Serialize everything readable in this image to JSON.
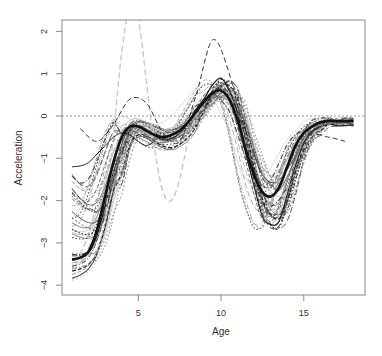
{
  "chart_data": {
    "type": "line",
    "title": "",
    "xlabel": "Age",
    "ylabel": "Acceleration",
    "xlim": [
      1,
      18
    ],
    "ylim": [
      -4.2,
      2.2
    ],
    "x_ticks": [
      5,
      10,
      15
    ],
    "x_tick_labels": [
      "5",
      "10",
      "15"
    ],
    "y_ticks": [
      -4,
      -3,
      -2,
      -1,
      0,
      1,
      2
    ],
    "y_tick_labels": [
      "-4",
      "-3",
      "-2",
      "-1",
      "0",
      "1",
      "2"
    ],
    "grid": false,
    "legend": null,
    "reference_line": {
      "y": 0,
      "style": "dotted",
      "color": "#888888"
    },
    "mean_curve": {
      "name": "mean",
      "style": "solid-thick",
      "color": "#111111",
      "x": [
        1,
        1.5,
        2,
        2.5,
        3,
        3.5,
        4,
        4.5,
        5,
        5.5,
        6,
        6.5,
        7,
        7.5,
        8,
        8.5,
        9,
        9.5,
        10,
        10.5,
        11,
        11.5,
        12,
        12.5,
        13,
        13.5,
        14,
        14.5,
        15,
        15.5,
        16,
        16.5,
        17,
        17.5,
        18
      ],
      "values": [
        -3.4,
        -3.35,
        -3.2,
        -2.7,
        -1.9,
        -1.1,
        -0.5,
        -0.25,
        -0.25,
        -0.35,
        -0.45,
        -0.5,
        -0.45,
        -0.35,
        -0.15,
        0.1,
        0.35,
        0.55,
        0.6,
        0.4,
        -0.1,
        -0.8,
        -1.4,
        -1.8,
        -1.9,
        -1.7,
        -1.2,
        -0.7,
        -0.4,
        -0.25,
        -0.15,
        -0.12,
        -0.12,
        -0.12,
        -0.12
      ]
    },
    "individual_curves_note": "~40 individual smoothed acceleration curves in assorted gray shades and line types (solid, dashed, dotted, dash-dot) surrounding the mean curve",
    "series_envelope": {
      "x": [
        1,
        3,
        4.5,
        5,
        7,
        9,
        10,
        11,
        12,
        13,
        14,
        16,
        18
      ],
      "upper": [
        -1.1,
        -0.8,
        0.7,
        2.2,
        -0.1,
        1.85,
        1.8,
        1.2,
        0.6,
        -1.0,
        0.3,
        0.35,
        0.3
      ],
      "lower": [
        -4.2,
        -4.2,
        -3.5,
        -1.0,
        -2.0,
        -0.7,
        -0.3,
        -1.2,
        -2.5,
        -3.1,
        -3.0,
        -1.5,
        -0.9
      ]
    }
  }
}
